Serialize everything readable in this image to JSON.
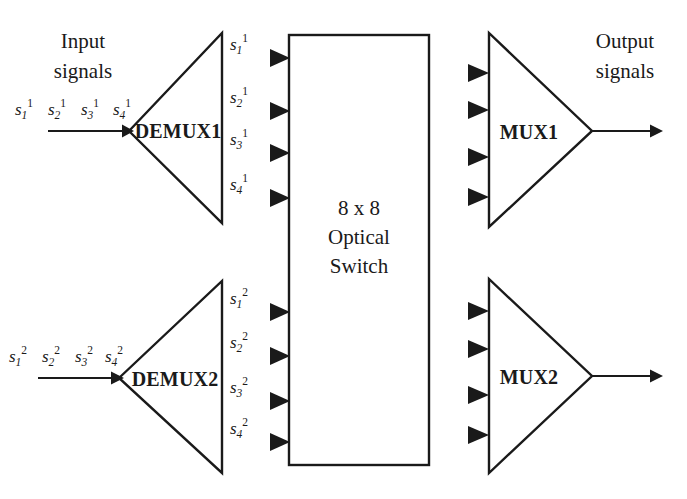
{
  "diagram": {
    "title_left": "Input\nsignals",
    "title_right": "Output\nsignals",
    "input_label_line1": "Input",
    "input_label_line2": "signals",
    "output_label_line1": "Output",
    "output_label_line2": "signals",
    "switch": {
      "line1": "8 x 8",
      "line2": "Optical",
      "line3": "Switch"
    },
    "blocks": {
      "demux1": "DEMUX1",
      "demux2": "DEMUX2",
      "mux1": "MUX1",
      "mux2": "MUX2"
    },
    "input_bundle_top": [
      {
        "base": "s",
        "sub": "1",
        "sup": "1"
      },
      {
        "base": "s",
        "sub": "2",
        "sup": "1"
      },
      {
        "base": "s",
        "sub": "3",
        "sup": "1"
      },
      {
        "base": "s",
        "sub": "4",
        "sup": "1"
      }
    ],
    "input_bundle_bottom": [
      {
        "base": "s",
        "sub": "1",
        "sup": "2"
      },
      {
        "base": "s",
        "sub": "2",
        "sup": "2"
      },
      {
        "base": "s",
        "sub": "3",
        "sup": "2"
      },
      {
        "base": "s",
        "sub": "4",
        "sup": "2"
      }
    ],
    "demux1_outputs": [
      {
        "base": "s",
        "sub": "1",
        "sup": "1"
      },
      {
        "base": "s",
        "sub": "2",
        "sup": "1"
      },
      {
        "base": "s",
        "sub": "3",
        "sup": "1"
      },
      {
        "base": "s",
        "sub": "4",
        "sup": "1"
      }
    ],
    "demux2_outputs": [
      {
        "base": "s",
        "sub": "1",
        "sup": "2"
      },
      {
        "base": "s",
        "sub": "2",
        "sup": "2"
      },
      {
        "base": "s",
        "sub": "3",
        "sup": "2"
      },
      {
        "base": "s",
        "sub": "4",
        "sup": "2"
      }
    ],
    "colors": {
      "ink": "#1a1a1a",
      "background": "#ffffff"
    }
  }
}
